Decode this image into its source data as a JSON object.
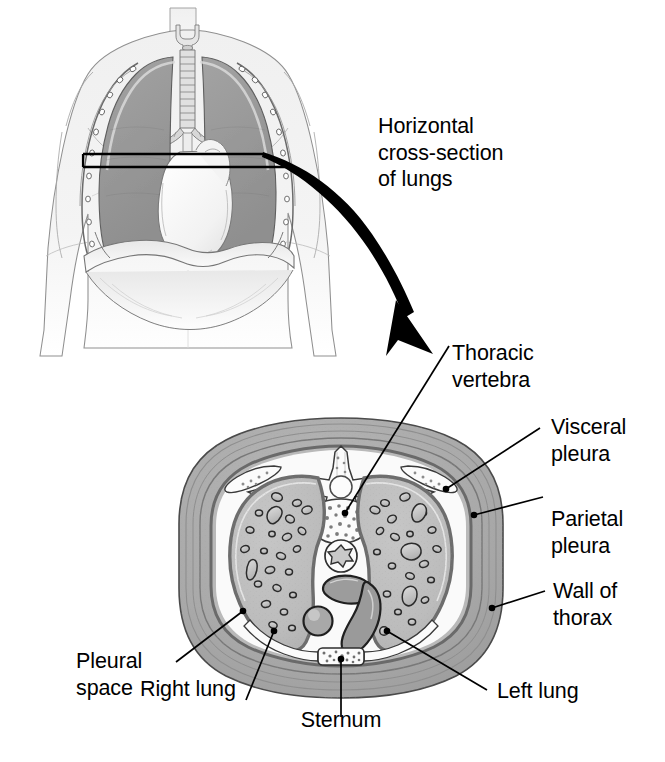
{
  "figure": {
    "type": "anatomical-diagram"
  },
  "callout": {
    "text": "Horizontal\ncross-section\nof lungs"
  },
  "labels": {
    "thoracic_vertebra": "Thoracic\nvertebra",
    "visceral_pleura": "Visceral\npleura",
    "parietal_pleura": "Parietal\npleura",
    "wall_of_thorax": "Wall of\nthorax",
    "left_lung": "Left lung",
    "sternum": "Sternum",
    "right_lung": "Right lung",
    "pleural_space": "Pleural\nspace"
  },
  "colors": {
    "ink": "#000000",
    "outline": "#3a3a3a",
    "body_skin": "#f2f2f2",
    "body_line": "#8a8a8a",
    "torso_lung": "#9b9b9b",
    "torso_lung_dark": "#808080",
    "heart": "#fbfbfb",
    "thorax_wall": "#a8a8a8",
    "thorax_wall_inner": "#b4b4b4",
    "pleura_line": "#6e6e6e",
    "pleural_space": "#fafafa",
    "lung_tissue": "#bcbcbc",
    "vessel_fill": "#cfcfcf",
    "vessel_outline": "#2b2b2b",
    "bone": "#fafafa",
    "marrow": "#8d8d8d",
    "mediastinum": "#b0b0b0"
  },
  "anatomy": {
    "torso_parts": [
      "larynx",
      "trachea",
      "right lung",
      "left lung",
      "heart",
      "diaphragm",
      "ribs"
    ],
    "cross_section_parts": [
      "wall of thorax",
      "parietal pleura",
      "pleural space",
      "visceral pleura",
      "right lung",
      "left lung",
      "thoracic vertebra",
      "spinal canal",
      "ribs",
      "esophagus",
      "aorta",
      "vena cava",
      "sternum",
      "mediastinum"
    ]
  }
}
